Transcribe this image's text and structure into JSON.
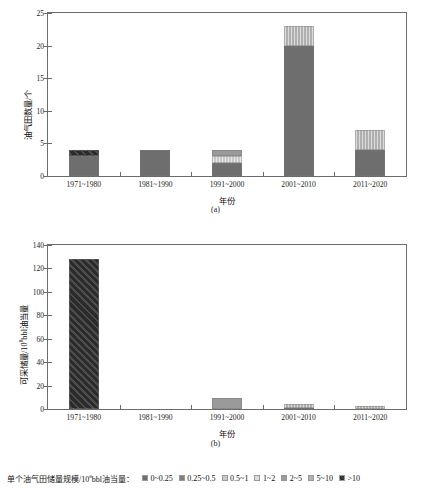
{
  "legend": {
    "title_prefix": "单个油气田储量规模/10",
    "title_exp": "8",
    "title_suffix": "bbl油当量：",
    "items": [
      {
        "label": "0~0.25",
        "color": "#6e6e6e",
        "hatch": "none"
      },
      {
        "label": "0.25~0.5",
        "color": "#7f7f7f",
        "hatch": "none"
      },
      {
        "label": "0.5~1",
        "color": "#c9c9c9",
        "hatch": "none"
      },
      {
        "label": "1~2",
        "color": "#dedede",
        "hatch": "none"
      },
      {
        "label": "2~5",
        "color": "#9a9a9a",
        "hatch": "none"
      },
      {
        "label": "5~10",
        "color": "#b0b0b0",
        "hatch": "none"
      },
      {
        "label": ">10",
        "color": "#2b2b2b",
        "hatch": "none"
      }
    ]
  },
  "panel_a": {
    "caption": "(a)",
    "ylabel": "油气田数量/个",
    "xlabel": "年份",
    "chart_data": {
      "type": "bar",
      "stacked": true,
      "title": "",
      "xlabel": "年份",
      "ylabel": "油气田数量/个",
      "ylim": [
        0,
        25
      ],
      "yticks": [
        0,
        5,
        10,
        15,
        20,
        25
      ],
      "grid": false,
      "legend_position": "bottom",
      "categories": [
        "1971~1980",
        "1981~1990",
        "1991~2000",
        "2001~2010",
        "2011~2020"
      ],
      "series": [
        {
          "name": "0~0.25",
          "color": "#6e6e6e",
          "values": [
            3,
            4,
            2,
            20,
            4
          ]
        },
        {
          "name": "0.25~0.5",
          "color": "#7f7f7f",
          "values": [
            0,
            0,
            0,
            0,
            0
          ]
        },
        {
          "name": "0.5~1",
          "color": "#c9c9c9",
          "values": [
            0,
            0,
            1,
            0,
            0
          ]
        },
        {
          "name": "1~2",
          "color": "#dedede",
          "values": [
            0,
            0,
            0,
            0,
            0
          ]
        },
        {
          "name": "2~5",
          "color": "#9a9a9a",
          "values": [
            0,
            0,
            1,
            0,
            0
          ]
        },
        {
          "name": "5~10",
          "color": "#b0b0b0",
          "values": [
            0,
            0,
            0,
            3,
            3
          ]
        },
        {
          "name": ">10",
          "color": "#2b2b2b",
          "values": [
            1,
            0,
            0,
            0,
            0
          ]
        }
      ],
      "totals": [
        4,
        4,
        4,
        23,
        7
      ]
    }
  },
  "panel_b": {
    "caption": "(b)",
    "ylabel_prefix": "可采储量/10",
    "ylabel_exp": "8",
    "ylabel_suffix": "bbl油当量",
    "xlabel": "年份",
    "chart_data": {
      "type": "bar",
      "stacked": true,
      "title": "",
      "xlabel": "年份",
      "ylabel": "可采储量/10^8bbl油当量",
      "ylim": [
        0,
        140
      ],
      "yticks": [
        0,
        20,
        40,
        60,
        80,
        100,
        120,
        140
      ],
      "grid": false,
      "legend_position": "bottom",
      "categories": [
        "1971~1980",
        "1981~1990",
        "1991~2000",
        "2001~2010",
        "2011~2020"
      ],
      "series": [
        {
          "name": "0~0.25",
          "color": "#6e6e6e",
          "values": [
            0,
            0,
            0,
            1,
            0.4
          ]
        },
        {
          "name": "2~5",
          "color": "#9a9a9a",
          "values": [
            0,
            0,
            9,
            0,
            0
          ]
        },
        {
          "name": "5~10",
          "color": "#b0b0b0",
          "values": [
            0,
            0,
            0,
            3,
            2.6
          ]
        },
        {
          "name": ">10",
          "color": "#2b2b2b",
          "values": [
            128,
            0,
            0,
            0,
            0
          ]
        }
      ],
      "totals": [
        128,
        0,
        9,
        4,
        3
      ]
    }
  }
}
